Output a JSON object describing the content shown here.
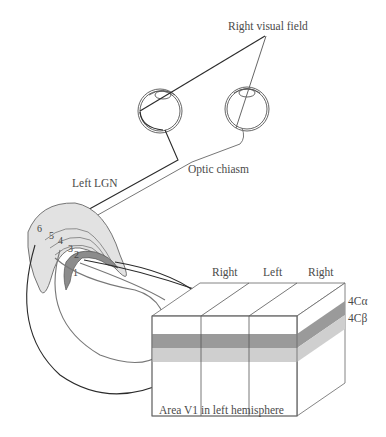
{
  "labels": {
    "right_visual_field": "Right visual field",
    "optic_chiasm": "Optic chiasm",
    "left_lgn": "Left LGN",
    "area_v1": "Area V1 in left hemisphere",
    "layer_4c_alpha": "4Cα",
    "layer_4c_beta": "4Cβ",
    "columns": [
      "Right",
      "Left",
      "Right"
    ],
    "lgn_layers": [
      "1",
      "2",
      "3",
      "4",
      "5",
      "6"
    ]
  },
  "colors": {
    "line_dark": "#2a2a2a",
    "line_mid": "#6a6a6a",
    "lgn_fill": "#e4e4e4",
    "lgn_layer_dark": "#8c8c8c",
    "band_4c_alpha": "#9a9a9a",
    "band_4c_beta": "#cfcfcf",
    "text": "#4a4a4a"
  }
}
